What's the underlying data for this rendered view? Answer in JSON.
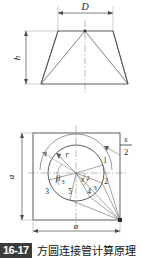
{
  "figure": {
    "caption_number": "16-17",
    "caption_text": "方圆连接管计算原理",
    "elevation": {
      "top_dimension_label": "D",
      "height_dimension_label": "h"
    },
    "plan": {
      "width_dimension_label": "a",
      "height_dimension_label": "a",
      "arc_label_numerator": "s",
      "arc_label_denominator": "2",
      "radius_label": "r",
      "angle_label": "β",
      "angle_subscript": "3",
      "point_labels": [
        "1",
        "2",
        "3",
        "4",
        "5"
      ],
      "inner_labels": [
        "3",
        "2",
        "4",
        "3",
        "5"
      ]
    },
    "colors": {
      "line": "#4a4a4a",
      "thin_line": "#7d7d7d",
      "center_line": "#8a8a8a",
      "badge_bg": "#3a3a3a",
      "badge_text": "#ffffff"
    }
  }
}
